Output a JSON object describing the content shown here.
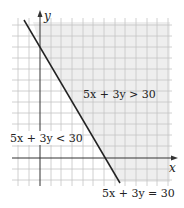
{
  "diagram": {
    "type": "linear-inequality-graph",
    "axes": {
      "x_label": "x",
      "y_label": "y"
    },
    "boundary_line": {
      "equation": "5x + 3y = 30",
      "x_intercept": 6,
      "y_intercept": 10,
      "style": "solid"
    },
    "regions": [
      {
        "label": "5x + 3y > 30",
        "shaded": true
      },
      {
        "label": "5x + 3y < 30",
        "shaded": false
      }
    ],
    "labels": {
      "greater": "5x + 3y > 30",
      "less": "5x + 3y < 30",
      "equal": "5x + 3y = 30"
    },
    "colors": {
      "shade": "#eeeeee",
      "grid": "#bdbdbd",
      "line": "#222222"
    }
  }
}
